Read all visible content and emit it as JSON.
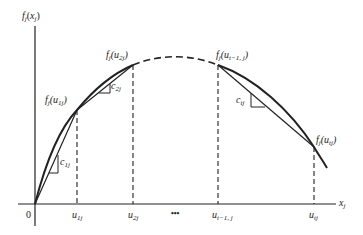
{
  "diagram": {
    "y_axis_label": {
      "f": "f",
      "sub": "j",
      "open": "(",
      "var": "x",
      "var_sub": "j",
      "close": ")"
    },
    "x_axis_label": {
      "var": "x",
      "sub": "j"
    },
    "origin_label": "0",
    "ellipsis": "•••",
    "ticks": [
      {
        "var": "u",
        "sub": "1j"
      },
      {
        "var": "u",
        "sub": "2j"
      },
      {
        "var": "u",
        "sub": "t−1, j"
      },
      {
        "var": "u",
        "sub": "tj"
      }
    ],
    "points": [
      {
        "f": "f",
        "f_sub": "j",
        "var": "u",
        "sub": "1j"
      },
      {
        "f": "f",
        "f_sub": "j",
        "var": "u",
        "sub": "2j"
      },
      {
        "f": "f",
        "f_sub": "j",
        "var": "u",
        "sub": "t−1, j"
      },
      {
        "f": "f",
        "f_sub": "j",
        "var": "u",
        "sub": "tj"
      }
    ],
    "slopes": [
      {
        "var": "c",
        "sub": "1j"
      },
      {
        "var": "c",
        "sub": "2j"
      },
      {
        "var": "c",
        "sub": "tj"
      }
    ],
    "colors": {
      "ink": "#222222",
      "background": "#ffffff"
    }
  }
}
